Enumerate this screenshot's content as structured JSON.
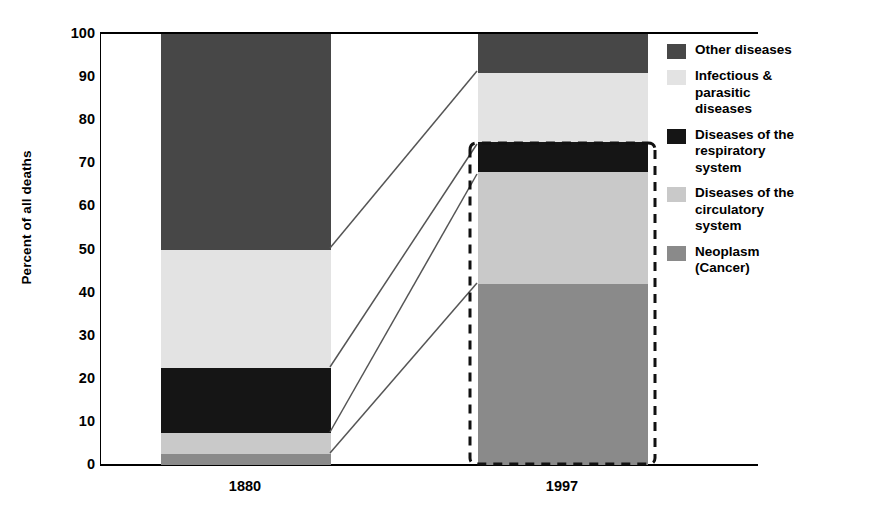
{
  "chart_data": {
    "type": "bar",
    "subtype": "stacked-bar-100-percent",
    "title": "",
    "xlabel": "",
    "ylabel": "Percent of all deaths",
    "ylim": [
      0,
      100
    ],
    "y_ticks": [
      100,
      90,
      80,
      70,
      60,
      50,
      40,
      30,
      20,
      10,
      0
    ],
    "y_tick_labels": [
      "100",
      "90",
      "80",
      "70",
      "60",
      "50",
      "40",
      "30",
      "20",
      "10",
      "0"
    ],
    "categories": [
      "1880",
      "1997"
    ],
    "grid": false,
    "legend_position": "right",
    "stack_order_bottom_to_top": [
      "Neoplasm (Cancer)",
      "Diseases of the circulatory system",
      "Diseases of the respiratory system",
      "Infectious & parasitic diseases",
      "Other diseases"
    ],
    "series": [
      {
        "name": "Neoplasm (Cancer)",
        "color": "#8a8a8a",
        "values": [
          2.5,
          42
        ]
      },
      {
        "name": "Diseases of the circulatory system",
        "color": "#c9c9c9",
        "values": [
          5.0,
          26
        ]
      },
      {
        "name": "Diseases of the respiratory system",
        "color": "#151515",
        "values": [
          15.0,
          7
        ]
      },
      {
        "name": "Infectious & parasitic diseases",
        "color": "#e3e3e3",
        "values": [
          27.5,
          16
        ]
      },
      {
        "name": "Other diseases",
        "color": "#474747",
        "values": [
          50.0,
          9
        ]
      }
    ],
    "cumulative_boundaries": {
      "1880": [
        0,
        2.5,
        7.5,
        22.5,
        50,
        100
      ],
      "1997": [
        0,
        42,
        68,
        75,
        91,
        100
      ]
    },
    "annotations": [
      {
        "type": "callout-box",
        "style": "dashed",
        "target": "1997 bar",
        "note": "dashed highlight rectangle around the 1997 column"
      },
      {
        "type": "connector-lines",
        "count": 3,
        "note": "lines linking 1880 segment boundaries to 1997 segment boundaries"
      }
    ]
  },
  "axis": {
    "y_title": "Percent of all deaths",
    "ticks": [
      {
        "label": "100",
        "value": 100
      },
      {
        "label": "90",
        "value": 90
      },
      {
        "label": "80",
        "value": 80
      },
      {
        "label": "70",
        "value": 70
      },
      {
        "label": "60",
        "value": 60
      },
      {
        "label": "50",
        "value": 50
      },
      {
        "label": "40",
        "value": 40
      },
      {
        "label": "30",
        "value": 30
      },
      {
        "label": "20",
        "value": 20
      },
      {
        "label": "10",
        "value": 10
      },
      {
        "label": "0",
        "value": 0
      }
    ],
    "x_labels": [
      "1880",
      "1997"
    ]
  },
  "legend": {
    "items": [
      {
        "label": "Other diseases",
        "color": "#474747"
      },
      {
        "label": "Infectious &\nparasitic\ndiseases",
        "color": "#e3e3e3"
      },
      {
        "label": "Diseases of the\nrespiratory\nsystem",
        "color": "#151515"
      },
      {
        "label": "Diseases of the\ncirculatory\nsystem",
        "color": "#c9c9c9"
      },
      {
        "label": "Neoplasm\n(Cancer)",
        "color": "#8a8a8a"
      }
    ]
  },
  "colors": {
    "other": "#474747",
    "infectious": "#e3e3e3",
    "respiratory": "#151515",
    "circulatory": "#c9c9c9",
    "neoplasm": "#8a8a8a",
    "axis": "#000000",
    "background": "#ffffff",
    "annotation": "#555555"
  }
}
